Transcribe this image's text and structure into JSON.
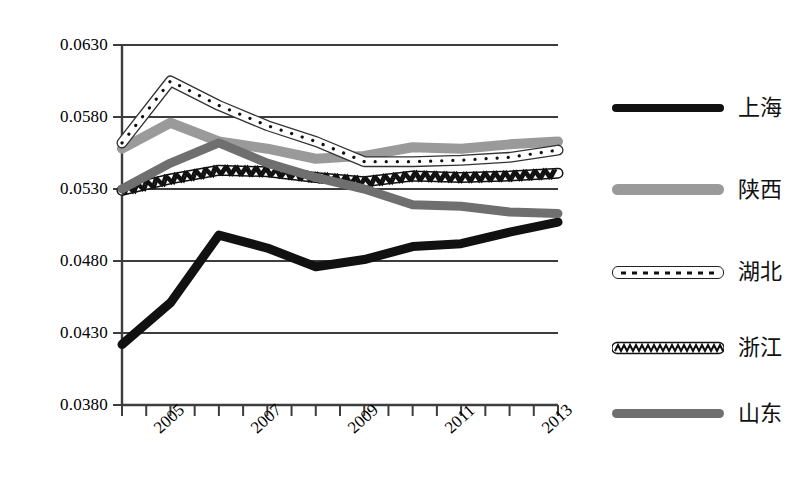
{
  "chart_data": {
    "type": "line",
    "title": "",
    "subtitle": "",
    "xlabel": "",
    "ylabel": "",
    "grid": true,
    "legend_position": "right",
    "x": [
      2004,
      2005,
      2006,
      2007,
      2008,
      2009,
      2010,
      2011,
      2012,
      2013
    ],
    "categories": [
      "2004",
      "2005",
      "2006",
      "2007",
      "2008",
      "2009",
      "2010",
      "2011",
      "2012",
      "2013"
    ],
    "xtick_labels": [
      "",
      "2005",
      "",
      "2007",
      "",
      "2009",
      "",
      "2011",
      "",
      "2013"
    ],
    "ytick_labels": [
      "0.0380",
      "0.0430",
      "0.0480",
      "0.0530",
      "0.0580",
      "0.0630"
    ],
    "ytick_values": [
      0.038,
      0.043,
      0.048,
      0.053,
      0.058,
      0.063
    ],
    "ylim": [
      0.038,
      0.063
    ],
    "xlim": [
      2004,
      2013
    ],
    "series": [
      {
        "name": "上海",
        "style": "solid-black",
        "color": "#111111",
        "values": [
          0.0422,
          0.0451,
          0.0498,
          0.0489,
          0.0476,
          0.0481,
          0.049,
          0.0492,
          0.05,
          0.0507
        ]
      },
      {
        "name": "陕西",
        "style": "solid-light-gray",
        "color": "#9a9a9a",
        "values": [
          0.0558,
          0.0576,
          0.0563,
          0.0558,
          0.0551,
          0.0553,
          0.0559,
          0.0558,
          0.0561,
          0.0563
        ]
      },
      {
        "name": "湖北",
        "style": "white-dotted",
        "color": "#ffffff",
        "values": [
          0.0562,
          0.0605,
          0.0588,
          0.0574,
          0.0563,
          0.0549,
          0.0549,
          0.055,
          0.0552,
          0.0557
        ]
      },
      {
        "name": "浙江",
        "style": "zigzag",
        "color": "#111111",
        "values": [
          0.0529,
          0.0537,
          0.0543,
          0.0542,
          0.0538,
          0.0535,
          0.0539,
          0.0538,
          0.0539,
          0.0541
        ]
      },
      {
        "name": "山东",
        "style": "solid-mid-gray",
        "color": "#6f6f6f",
        "values": [
          0.053,
          0.0548,
          0.0562,
          0.0548,
          0.0538,
          0.053,
          0.0519,
          0.0518,
          0.0514,
          0.0513
        ]
      }
    ]
  },
  "legend": {
    "items": [
      {
        "label": "上海",
        "key": "solid-black"
      },
      {
        "label": "陕西",
        "key": "solid-light-gray"
      },
      {
        "label": "湖北",
        "key": "white-dotted"
      },
      {
        "label": "浙江",
        "key": "zigzag"
      },
      {
        "label": "山东",
        "key": "solid-mid-gray"
      }
    ]
  },
  "colors": {
    "axis": "#3d3d3d",
    "grid": "#3d3d3d",
    "background": "#ffffff",
    "shanghai": "#111111",
    "shaanxi": "#9a9a9a",
    "hubei": "#ffffff",
    "zhejiang": "#111111",
    "shandong": "#6f6f6f"
  }
}
